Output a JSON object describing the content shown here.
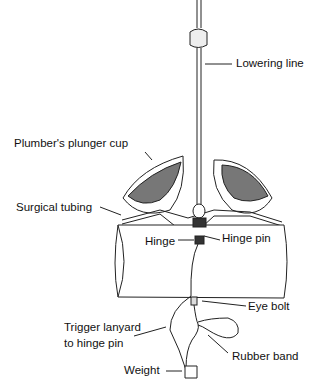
{
  "diagram": {
    "labels": {
      "lowering_line": "Lowering line",
      "plunger_cup": "Plumber's plunger cup",
      "surgical_tubing": "Surgical tubing",
      "hinge": "Hinge",
      "hinge_pin": "Hinge pin",
      "eye_bolt": "Eye bolt",
      "trigger_lanyard_1": "Trigger lanyard",
      "trigger_lanyard_2": "to hinge pin",
      "rubber_band": "Rubber band",
      "weight": "Weight"
    }
  }
}
